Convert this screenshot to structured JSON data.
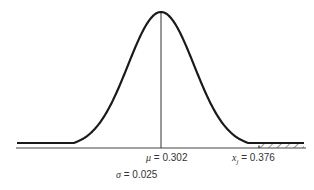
{
  "chart_data": {
    "type": "line",
    "title": "",
    "distribution": "normal",
    "mean": 0.302,
    "sigma": 0.025,
    "threshold": 0.376,
    "shaded_region": "right tail, x > 0.376",
    "xlabel": "",
    "ylabel": "",
    "annotations": [
      {
        "symbol": "μ",
        "text": "= 0.302"
      },
      {
        "symbol": "x",
        "subscript": "j",
        "text": "= 0.376"
      },
      {
        "symbol": "σ",
        "text": "= 0.025"
      }
    ],
    "grid": false,
    "legend": null
  },
  "labels": {
    "mu_symbol": "μ",
    "mu_value": "= 0.302",
    "xj_symbol": "x",
    "xj_sub": "j",
    "xj_value": "= 0.376",
    "sigma_symbol": "σ",
    "sigma_value": "= 0.025"
  },
  "colors": {
    "curve": "#1a1a1a",
    "axis": "#444444",
    "hatch": "#333333"
  }
}
